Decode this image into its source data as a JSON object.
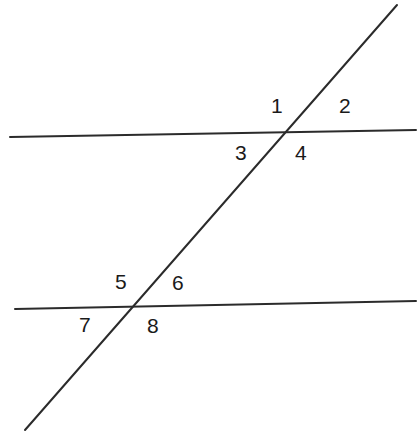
{
  "canvas": {
    "width": 418,
    "height": 434,
    "background": "#ffffff"
  },
  "figure": {
    "stroke_color": "#2b2b2b",
    "label_color": "#1a1a1a",
    "line_width": 2
  },
  "lines": [
    {
      "name": "upper-horizontal-line",
      "x1": 10,
      "y1": 137,
      "x2": 416,
      "y2": 130
    },
    {
      "name": "lower-horizontal-line",
      "x1": 15,
      "y1": 309,
      "x2": 416,
      "y2": 301
    },
    {
      "name": "transversal-line",
      "x1": 397,
      "y1": 5,
      "x2": 25,
      "y2": 430
    }
  ],
  "intersections": [
    {
      "name": "upper-intersection",
      "x": 292,
      "y": 133
    },
    {
      "name": "lower-intersection",
      "x": 139,
      "y": 307
    }
  ],
  "labels": [
    {
      "id": "angle-1",
      "text": "1",
      "x": 271,
      "y": 95
    },
    {
      "id": "angle-2",
      "text": "2",
      "x": 339,
      "y": 95
    },
    {
      "id": "angle-3",
      "text": "3",
      "x": 235,
      "y": 142
    },
    {
      "id": "angle-4",
      "text": "4",
      "x": 295,
      "y": 142
    },
    {
      "id": "angle-5",
      "text": "5",
      "x": 115,
      "y": 271
    },
    {
      "id": "angle-6",
      "text": "6",
      "x": 172,
      "y": 272
    },
    {
      "id": "angle-7",
      "text": "7",
      "x": 79,
      "y": 314
    },
    {
      "id": "angle-8",
      "text": "8",
      "x": 147,
      "y": 315
    }
  ]
}
